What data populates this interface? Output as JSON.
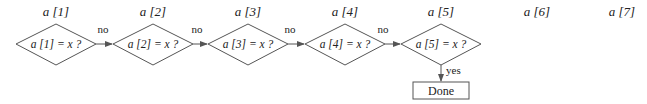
{
  "columns": [
    {
      "label": "a [1]",
      "x": 56
    },
    {
      "label": "a [2]",
      "x": 153
    },
    {
      "label": "a [3]",
      "x": 248
    },
    {
      "label": "a [4]",
      "x": 345
    },
    {
      "label": "a [5]",
      "x": 441
    },
    {
      "label": "a [6]",
      "x": 537
    },
    {
      "label": "a [7]",
      "x": 622
    }
  ],
  "decisions": [
    {
      "text": "a [1] = x ?"
    },
    {
      "text": "a [2] = x ?"
    },
    {
      "text": "a [3] = x ?"
    },
    {
      "text": "a [4] = x ?"
    },
    {
      "text": "a [5] = x ?"
    }
  ],
  "edges": {
    "no_label": "no",
    "yes_label": "yes"
  },
  "terminal": {
    "text": "Done"
  },
  "colors": {
    "stroke": "#555555",
    "text": "#222222",
    "background": "#ffffff"
  }
}
